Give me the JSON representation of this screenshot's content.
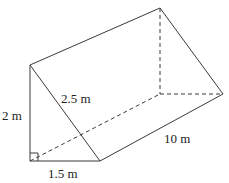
{
  "figure": {
    "type": "triangular prism",
    "labels": {
      "height": "2 m",
      "hypotenuse": "2.5 m",
      "base": "1.5 m",
      "length": "10 m"
    },
    "right_angle_marker": true,
    "colors": {
      "line": "#3a3a3a",
      "text": "#222222",
      "background": "#ffffff"
    }
  }
}
